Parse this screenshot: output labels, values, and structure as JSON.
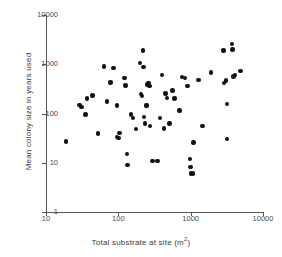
{
  "chart_data": {
    "type": "scatter",
    "title": "",
    "xlabel": "Total substrate at site (m2)",
    "xlabel_base": "Total substrate at site (m",
    "xlabel_sup": "2",
    "xlabel_tail": ")",
    "ylabel": "Mean colony size in years used",
    "xscale": "log",
    "yscale": "log",
    "xlim": [
      10,
      10000
    ],
    "ylim": [
      1,
      10000
    ],
    "xticks": [
      10,
      100,
      1000,
      10000
    ],
    "xtick_labels": [
      "10",
      "100",
      "1000",
      "10000"
    ],
    "yticks": [
      1,
      10,
      100,
      1000,
      10000
    ],
    "ytick_labels": [
      "1",
      "10",
      "100",
      "1000",
      "10000"
    ],
    "grid": false,
    "legend": false,
    "marker": "filled-circle",
    "marker_color": "#111111",
    "marker_size_px": 4.4,
    "axis_color": "#555555",
    "n_points": 74,
    "points": [
      {
        "x": 19,
        "y": 27
      },
      {
        "x": 29,
        "y": 150
      },
      {
        "x": 31,
        "y": 135
      },
      {
        "x": 35,
        "y": 95
      },
      {
        "x": 37,
        "y": 200
      },
      {
        "x": 44,
        "y": 230
      },
      {
        "x": 52,
        "y": 39
      },
      {
        "x": 63,
        "y": 900
      },
      {
        "x": 70,
        "y": 175
      },
      {
        "x": 78,
        "y": 430
      },
      {
        "x": 86,
        "y": 850
      },
      {
        "x": 95,
        "y": 145
      },
      {
        "x": 96,
        "y": 33
      },
      {
        "x": 100,
        "y": 32
      },
      {
        "x": 104,
        "y": 40
      },
      {
        "x": 122,
        "y": 520
      },
      {
        "x": 126,
        "y": 370
      },
      {
        "x": 131,
        "y": 15
      },
      {
        "x": 134,
        "y": 9
      },
      {
        "x": 150,
        "y": 95
      },
      {
        "x": 158,
        "y": 80
      },
      {
        "x": 175,
        "y": 48
      },
      {
        "x": 200,
        "y": 1050
      },
      {
        "x": 207,
        "y": 250
      },
      {
        "x": 212,
        "y": 225
      },
      {
        "x": 218,
        "y": 1900
      },
      {
        "x": 222,
        "y": 880
      },
      {
        "x": 225,
        "y": 85
      },
      {
        "x": 232,
        "y": 63
      },
      {
        "x": 240,
        "y": 145
      },
      {
        "x": 250,
        "y": 145
      },
      {
        "x": 252,
        "y": 390
      },
      {
        "x": 262,
        "y": 420
      },
      {
        "x": 268,
        "y": 360
      },
      {
        "x": 275,
        "y": 56
      },
      {
        "x": 290,
        "y": 11
      },
      {
        "x": 300,
        "y": 11
      },
      {
        "x": 340,
        "y": 11
      },
      {
        "x": 352,
        "y": 11
      },
      {
        "x": 380,
        "y": 80
      },
      {
        "x": 400,
        "y": 610
      },
      {
        "x": 430,
        "y": 50
      },
      {
        "x": 450,
        "y": 255
      },
      {
        "x": 470,
        "y": 205
      },
      {
        "x": 510,
        "y": 63
      },
      {
        "x": 560,
        "y": 295
      },
      {
        "x": 600,
        "y": 200
      },
      {
        "x": 700,
        "y": 115
      },
      {
        "x": 760,
        "y": 550
      },
      {
        "x": 830,
        "y": 520
      },
      {
        "x": 900,
        "y": 360
      },
      {
        "x": 980,
        "y": 12
      },
      {
        "x": 1000,
        "y": 8.2
      },
      {
        "x": 1020,
        "y": 6.1
      },
      {
        "x": 1080,
        "y": 6.0
      },
      {
        "x": 1100,
        "y": 26
      },
      {
        "x": 1280,
        "y": 480
      },
      {
        "x": 1450,
        "y": 56
      },
      {
        "x": 1900,
        "y": 680
      },
      {
        "x": 2850,
        "y": 1900
      },
      {
        "x": 2900,
        "y": 420
      },
      {
        "x": 3050,
        "y": 470
      },
      {
        "x": 3150,
        "y": 155
      },
      {
        "x": 3200,
        "y": 30
      },
      {
        "x": 3700,
        "y": 2550
      },
      {
        "x": 3800,
        "y": 2000
      },
      {
        "x": 3900,
        "y": 560
      },
      {
        "x": 4100,
        "y": 610
      },
      {
        "x": 4900,
        "y": 740
      }
    ]
  }
}
